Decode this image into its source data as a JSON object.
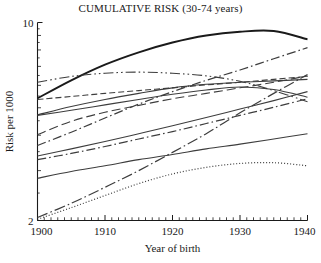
{
  "chart_data": {
    "type": "line",
    "title": "CUMULATIVE RISK (30-74 years)",
    "xlabel": "Year of birth",
    "ylabel": "Risk per 1000",
    "xlim": [
      1900,
      1940
    ],
    "ylim": [
      2,
      10
    ],
    "yscale": "log",
    "grid": false,
    "legend": "none",
    "xticks": [
      1900,
      1910,
      1920,
      1930,
      1940
    ],
    "xtick_labels": [
      "1900",
      "1910",
      "1920",
      "1930",
      "1940"
    ],
    "xminor_step": 1,
    "yticks": [
      2,
      3,
      4,
      5,
      6,
      7,
      8,
      9,
      10
    ],
    "ytick_labels": [
      "2",
      "",
      "",
      "",
      "",
      "",
      "",
      "",
      "10"
    ],
    "x": [
      1900,
      1905,
      1910,
      1915,
      1920,
      1925,
      1930,
      1935,
      1940
    ],
    "series": [
      {
        "name": "series-1",
        "style": "solid",
        "width": 1.9,
        "color": "#1a1a1a",
        "values": [
          5.4,
          6.25,
          7.1,
          7.85,
          8.5,
          9.0,
          9.28,
          9.33,
          8.72
        ]
      },
      {
        "name": "series-2",
        "style": "dashdotdot",
        "width": 1.1,
        "color": "#3d3d3d",
        "values": [
          6.15,
          6.45,
          6.62,
          6.68,
          6.62,
          6.48,
          6.2,
          5.75,
          5.25
        ]
      },
      {
        "name": "series-3",
        "style": "dashdot",
        "width": 1.2,
        "color": "#3d3d3d",
        "values": [
          3.68,
          4.1,
          4.6,
          5.15,
          5.7,
          6.25,
          6.8,
          7.45,
          8.15
        ]
      },
      {
        "name": "series-4",
        "style": "dashed",
        "width": 1.1,
        "color": "#3d3d3d",
        "values": [
          5.35,
          5.48,
          5.62,
          5.75,
          5.88,
          6.02,
          6.15,
          6.3,
          6.45
        ]
      },
      {
        "name": "series-5",
        "style": "dashed-long",
        "width": 1.1,
        "color": "#3d3d3d",
        "values": [
          4.02,
          4.48,
          4.82,
          5.1,
          5.38,
          5.62,
          5.88,
          6.15,
          6.48
        ]
      },
      {
        "name": "series-6",
        "style": "solid",
        "width": 1.1,
        "color": "#3d3d3d",
        "values": [
          4.72,
          5.05,
          5.35,
          5.62,
          5.88,
          6.05,
          6.15,
          6.22,
          6.3
        ]
      },
      {
        "name": "series-7",
        "style": "solid",
        "width": 1.1,
        "color": "#3d3d3d",
        "values": [
          4.7,
          4.9,
          5.12,
          5.35,
          5.58,
          5.78,
          5.92,
          5.8,
          5.45
        ]
      },
      {
        "name": "series-8",
        "style": "dashdot",
        "width": 1.2,
        "color": "#3d3d3d",
        "values": [
          3.28,
          3.45,
          3.65,
          3.88,
          4.12,
          4.4,
          4.7,
          5.02,
          5.38
        ]
      },
      {
        "name": "series-9",
        "style": "solid",
        "width": 1.1,
        "color": "#3d3d3d",
        "values": [
          3.38,
          3.58,
          3.8,
          4.05,
          4.32,
          4.62,
          4.95,
          5.3,
          5.7
        ]
      },
      {
        "name": "series-10",
        "style": "solid",
        "width": 1.1,
        "color": "#3d3d3d",
        "values": [
          2.82,
          2.98,
          3.12,
          3.28,
          3.42,
          3.58,
          3.72,
          3.88,
          4.05
        ]
      },
      {
        "name": "series-11",
        "style": "dashdot-long",
        "width": 1.2,
        "color": "#3d3d3d",
        "values": [
          2.05,
          2.3,
          2.62,
          3.0,
          3.48,
          4.05,
          4.8,
          5.62,
          6.55
        ]
      },
      {
        "name": "series-12",
        "style": "dotted",
        "width": 1.2,
        "color": "#3d3d3d",
        "values": [
          2.02,
          2.22,
          2.45,
          2.7,
          2.92,
          3.08,
          3.18,
          3.2,
          3.12
        ]
      }
    ]
  }
}
